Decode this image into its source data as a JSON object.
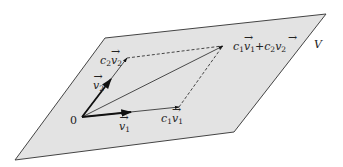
{
  "diagram": {
    "plane_label": "V",
    "origin_label": "0",
    "colors": {
      "plane_fill": "#e3e3e3",
      "plane_edge": "#444444",
      "vector": "#111111",
      "dashed": "#333333"
    },
    "plane_corners": [
      [
        105,
        38
      ],
      [
        326,
        14
      ],
      [
        234,
        132
      ],
      [
        15,
        160
      ]
    ],
    "points": {
      "origin": [
        82,
        117
      ],
      "v1": [
        130,
        113
      ],
      "c1v1": [
        179,
        107
      ],
      "v2": [
        111,
        79
      ],
      "c2v2": [
        127,
        58
      ],
      "sum": [
        224,
        46
      ]
    },
    "labels": {
      "v1": {
        "base": "v",
        "sub": "1"
      },
      "v2": {
        "base": "v",
        "sub": "2"
      },
      "c1v1": {
        "coef": "c",
        "coef_sub": "1",
        "base": "v",
        "sub": "1"
      },
      "c2v2": {
        "coef": "c",
        "coef_sub": "2",
        "base": "v",
        "sub": "2"
      },
      "sum": {
        "text": "c1v1 + c2v2",
        "plus": "+"
      }
    }
  }
}
